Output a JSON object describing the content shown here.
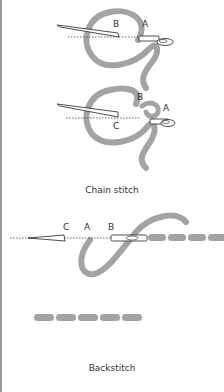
{
  "figures": {
    "chain_stitch": {
      "caption": "Chain stitch",
      "step1": {
        "labels": {
          "B": "B",
          "A": "A"
        }
      },
      "step2": {
        "labels": {
          "B": "B",
          "A": "A",
          "C": "C"
        }
      }
    },
    "backstitch": {
      "caption": "Backstitch",
      "step1": {
        "labels": {
          "C": "C",
          "A": "A",
          "B": "B"
        }
      }
    }
  },
  "colors": {
    "thread": "#a3a3a3",
    "outline": "#222222",
    "needle_fill": "#ffffff",
    "border": "#9a9a9a",
    "text": "#333333"
  }
}
